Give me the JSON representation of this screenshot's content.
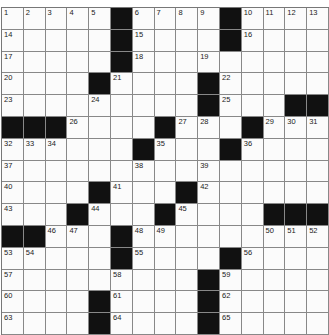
{
  "puzzle": {
    "size": 15,
    "grid": [
      [
        "1",
        "2",
        "3",
        "4",
        "5",
        "#",
        "6",
        "7",
        "8",
        "9",
        "#",
        "10",
        "11",
        "12",
        "13"
      ],
      [
        "14",
        "",
        "",
        "",
        "",
        "#",
        "15",
        "",
        "",
        "",
        "#",
        "16",
        "",
        "",
        ""
      ],
      [
        "17",
        "",
        "",
        "",
        "",
        "#",
        "18",
        "",
        "",
        "19",
        "",
        "",
        "",
        "",
        ""
      ],
      [
        "20",
        "",
        "",
        "",
        "#",
        "21",
        "",
        "",
        "",
        "#",
        "22",
        "",
        "",
        "",
        ""
      ],
      [
        "23",
        "",
        "",
        "",
        "24",
        "",
        "",
        "",
        "",
        "#",
        "25",
        "",
        "",
        "#",
        "#"
      ],
      [
        "#",
        "#",
        "#",
        "26",
        "",
        "",
        "",
        "#",
        "27",
        "28",
        "",
        "#",
        "29",
        "30",
        "31"
      ],
      [
        "32",
        "33",
        "34",
        "",
        "",
        "",
        "#",
        "35",
        "",
        "",
        "#",
        "36",
        "",
        "",
        ""
      ],
      [
        "37",
        "",
        "",
        "",
        "",
        "",
        "38",
        "",
        "",
        "39",
        "",
        "",
        "",
        "",
        ""
      ],
      [
        "40",
        "",
        "",
        "",
        "#",
        "41",
        "",
        "",
        "#",
        "42",
        "",
        "",
        "",
        "",
        ""
      ],
      [
        "43",
        "",
        "",
        "#",
        "44",
        "",
        "",
        "#",
        "45",
        "",
        "",
        "",
        "#",
        "#",
        "#"
      ],
      [
        "#",
        "#",
        "46",
        "47",
        "",
        "#",
        "48",
        "49",
        "",
        "",
        "",
        "",
        "50",
        "51",
        "52"
      ],
      [
        "53",
        "54",
        "",
        "",
        "",
        "#",
        "55",
        "",
        "",
        "",
        "#",
        "56",
        "",
        "",
        ""
      ],
      [
        "57",
        "",
        "",
        "",
        "",
        "58",
        "",
        "",
        "",
        "#",
        "59",
        "",
        "",
        "",
        ""
      ],
      [
        "60",
        "",
        "",
        "",
        "#",
        "61",
        "",
        "",
        "",
        "#",
        "62",
        "",
        "",
        "",
        ""
      ],
      [
        "63",
        "",
        "",
        "",
        "#",
        "64",
        "",
        "",
        "",
        "#",
        "65",
        "",
        "",
        "",
        ""
      ]
    ]
  }
}
